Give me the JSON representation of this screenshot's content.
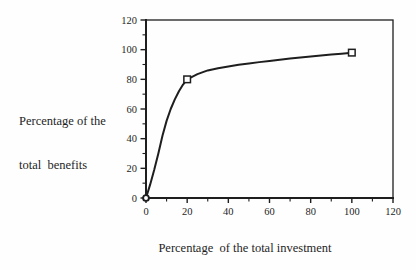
{
  "figure": {
    "background": "#fefefe",
    "ink": "#1e1e1e",
    "y_title_line1": "Percentage of the",
    "y_title_line2": "total  benefits"
  },
  "chart_data": {
    "type": "line",
    "title": "",
    "xlabel": "Percentage  of the total investment",
    "ylabel": "Percentage of the total benefits",
    "xlim": [
      0,
      120
    ],
    "ylim": [
      0,
      120
    ],
    "x_ticks": [
      0,
      20,
      40,
      60,
      80,
      100,
      120
    ],
    "y_ticks": [
      0,
      20,
      40,
      60,
      80,
      100,
      120
    ],
    "minor_tick_step": 10,
    "grid": false,
    "legend_position": "none",
    "frame": "full-box",
    "series": [
      {
        "name": "benefits_vs_investment",
        "points": [
          {
            "x": 0,
            "y": 0,
            "marker": "circle"
          },
          {
            "x": 20,
            "y": 80,
            "marker": "square"
          },
          {
            "x": 100,
            "y": 98,
            "marker": "square"
          }
        ],
        "marker_style": "open",
        "curve_samples": [
          [
            0,
            0
          ],
          [
            2,
            9
          ],
          [
            4,
            19
          ],
          [
            6,
            30
          ],
          [
            8,
            42
          ],
          [
            10,
            52
          ],
          [
            12,
            60
          ],
          [
            14,
            66.5
          ],
          [
            16,
            72
          ],
          [
            18,
            76.5
          ],
          [
            20,
            80
          ],
          [
            25,
            83.5
          ],
          [
            30,
            86
          ],
          [
            35,
            87.5
          ],
          [
            40,
            88.7
          ],
          [
            45,
            89.8
          ],
          [
            50,
            90.7
          ],
          [
            55,
            91.6
          ],
          [
            60,
            92.4
          ],
          [
            65,
            93.2
          ],
          [
            70,
            94
          ],
          [
            75,
            94.7
          ],
          [
            80,
            95.4
          ],
          [
            85,
            96
          ],
          [
            90,
            96.7
          ],
          [
            95,
            97.3
          ],
          [
            100,
            98
          ]
        ]
      }
    ]
  }
}
